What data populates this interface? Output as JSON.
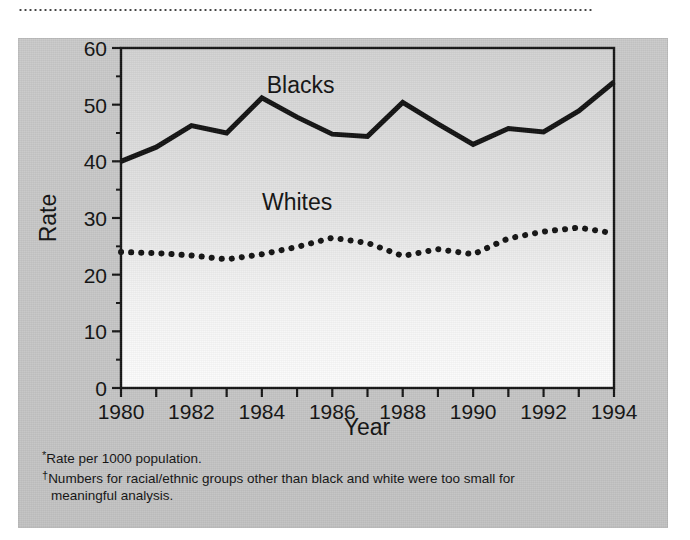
{
  "figure": {
    "top_rule": "dotted-rule",
    "y_axis_title": "Rate",
    "x_axis_title": "Year",
    "series_label_blacks": "Blacks",
    "series_label_whites": "Whites"
  },
  "footnotes": {
    "marker1": "*",
    "line1": "Rate per 1000 population.",
    "marker2": "†",
    "line2": "Numbers for racial/ethnic groups other than black and white were too small for",
    "line3": "meaningful analysis."
  },
  "colors": {
    "panel_background": "#c6c6c6",
    "plot_background_top": "#d0d0d0",
    "plot_background_bottom": "#fbfbfb",
    "ink": "#111111",
    "axis": "#1a1a1a"
  },
  "chart_data": {
    "type": "line",
    "title": "",
    "subtitle": "",
    "xlabel": "Year",
    "ylabel": "Rate",
    "xlim": [
      1980,
      1994
    ],
    "ylim": [
      0,
      60
    ],
    "y_ticks": [
      0,
      10,
      20,
      30,
      40,
      50,
      60
    ],
    "y_tick_labels": [
      "0",
      "10",
      "20",
      "30",
      "40",
      "50",
      "60"
    ],
    "y_minor_tick_step": 5,
    "x_ticks": [
      1980,
      1981,
      1982,
      1983,
      1984,
      1985,
      1986,
      1987,
      1988,
      1989,
      1990,
      1991,
      1992,
      1993,
      1994
    ],
    "x_tick_labels_shown": [
      "1980",
      "1982",
      "1984",
      "1986",
      "1988",
      "1990",
      "1992",
      "1994"
    ],
    "x_label_step": 2,
    "grid": false,
    "legend": "inline-labels",
    "x": [
      1980,
      1981,
      1982,
      1983,
      1984,
      1985,
      1986,
      1987,
      1988,
      1989,
      1990,
      1991,
      1992,
      1993,
      1994
    ],
    "series": [
      {
        "name": "Blacks",
        "style": "solid",
        "label_position": {
          "x": 1985.1,
          "y": 52.0
        },
        "values": [
          40.0,
          42.5,
          46.3,
          45.0,
          51.2,
          47.8,
          44.8,
          44.4,
          50.4,
          46.6,
          43.0,
          45.8,
          45.2,
          48.9,
          54.0
        ]
      },
      {
        "name": "Whites",
        "style": "dotted",
        "label_position": {
          "x": 1985.0,
          "y": 31.5
        },
        "values": [
          24.0,
          23.8,
          23.4,
          22.7,
          23.6,
          24.9,
          26.5,
          25.6,
          23.3,
          24.5,
          23.6,
          26.4,
          27.6,
          28.3,
          27.3
        ]
      }
    ],
    "annotations": [
      {
        "text": "Blacks",
        "x": 1985.1,
        "y": 52.0
      },
      {
        "text": "Whites",
        "x": 1985.0,
        "y": 31.5
      }
    ]
  }
}
